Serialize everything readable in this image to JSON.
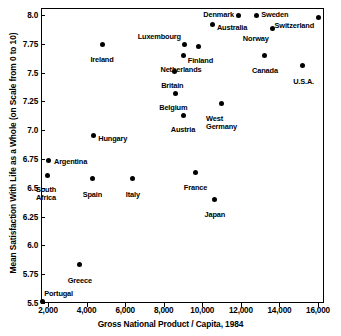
{
  "chart_data": {
    "type": "scatter",
    "title": "",
    "xlabel": "Gross National Product / Capita, 1984",
    "ylabel": "Mean Satisfaction With Life as a Whole (on Scale from 0 to 10)",
    "xlim": [
      1600,
      16400
    ],
    "ylim": [
      5.48,
      8.08
    ],
    "grid": false,
    "legend": "none",
    "xticks": [
      2000,
      4000,
      6000,
      8000,
      10000,
      12000,
      14000,
      16000
    ],
    "xticklabels": [
      "2,000",
      "4,000",
      "6,000",
      "8,000",
      "10,000",
      "12,000",
      "14,000",
      "16,000"
    ],
    "yticks": [
      5.5,
      5.75,
      6.0,
      6.25,
      6.5,
      6.75,
      7.0,
      7.25,
      7.5,
      7.75,
      8.0
    ],
    "yticklabels": [
      "5.5",
      "5.75",
      "6.0",
      "6.25",
      "6.5",
      "6.75",
      "7.0",
      "7.25",
      "7.5",
      "7.75",
      "8.0"
    ],
    "points": [
      {
        "name": "Denmark",
        "x": 11900,
        "y": 8.0,
        "label_pos": "left",
        "dx": -5,
        "dy": 0
      },
      {
        "name": "Sweden",
        "x": 12800,
        "y": 8.0,
        "label_pos": "right",
        "dx": 5,
        "dy": 0
      },
      {
        "name": "Switzerland",
        "x": 16000,
        "y": 7.98,
        "label_pos": "below-left",
        "dx": -4,
        "dy": 9
      },
      {
        "name": "Australia",
        "x": 10550,
        "y": 7.92,
        "label_pos": "right",
        "dx": 4,
        "dy": 4
      },
      {
        "name": "Norway",
        "x": 13650,
        "y": 7.88,
        "label_pos": "below-left",
        "dx": -4,
        "dy": 10
      },
      {
        "name": "Ireland",
        "x": 4800,
        "y": 7.74,
        "label_pos": "below",
        "dx": 0,
        "dy": 11
      },
      {
        "name": "Luxembourg",
        "x": 9100,
        "y": 7.74,
        "label_pos": "above-left",
        "dx": -4,
        "dy": -8
      },
      {
        "name": "Finland",
        "x": 9800,
        "y": 7.73,
        "label_pos": "below",
        "dx": 2,
        "dy": 11
      },
      {
        "name": "Netherlands",
        "x": 9000,
        "y": 7.65,
        "label_pos": "below",
        "dx": -2,
        "dy": 11
      },
      {
        "name": "Canada",
        "x": 13250,
        "y": 7.65,
        "label_pos": "below",
        "dx": 0,
        "dy": 12
      },
      {
        "name": "U.S.A.",
        "x": 15200,
        "y": 7.56,
        "label_pos": "below",
        "dx": 1,
        "dy": 12
      },
      {
        "name": "Britain",
        "x": 8550,
        "y": 7.51,
        "label_pos": "below",
        "dx": -2,
        "dy": 11
      },
      {
        "name": "Belgium",
        "x": 8600,
        "y": 7.32,
        "label_pos": "below",
        "dx": -2,
        "dy": 11
      },
      {
        "name": "West Germany",
        "x": 11000,
        "y": 7.23,
        "label_pos": "below",
        "dx": 0,
        "dy": 11
      },
      {
        "name": "Austria",
        "x": 9000,
        "y": 7.13,
        "label_pos": "below",
        "dx": 0,
        "dy": 11
      },
      {
        "name": "Hungary",
        "x": 4350,
        "y": 6.95,
        "label_pos": "right",
        "dx": 5,
        "dy": 3
      },
      {
        "name": "Argentina",
        "x": 2050,
        "y": 6.74,
        "label_pos": "right",
        "dx": 5,
        "dy": 2
      },
      {
        "name": "France",
        "x": 9650,
        "y": 6.63,
        "label_pos": "below",
        "dx": 0,
        "dy": 11
      },
      {
        "name": "South Africa",
        "x": 1950,
        "y": 6.61,
        "label_pos": "below",
        "dx": -1,
        "dy": 11
      },
      {
        "name": "Spain",
        "x": 4300,
        "y": 6.58,
        "label_pos": "below",
        "dx": 0,
        "dy": 12
      },
      {
        "name": "Italy",
        "x": 6400,
        "y": 6.58,
        "label_pos": "below",
        "dx": 0,
        "dy": 12
      },
      {
        "name": "Japan",
        "x": 10650,
        "y": 6.4,
        "label_pos": "below",
        "dx": 0,
        "dy": 12
      },
      {
        "name": "Greece",
        "x": 3650,
        "y": 5.83,
        "label_pos": "below",
        "dx": 0,
        "dy": 12
      },
      {
        "name": "Portugal",
        "x": 1700,
        "y": 5.51,
        "label_pos": "above-right",
        "dx": 2,
        "dy": -8
      }
    ],
    "multiline_labels": {
      "South Africa": [
        "South",
        "Africa"
      ],
      "West Germany": [
        "West",
        "Germany"
      ]
    }
  }
}
